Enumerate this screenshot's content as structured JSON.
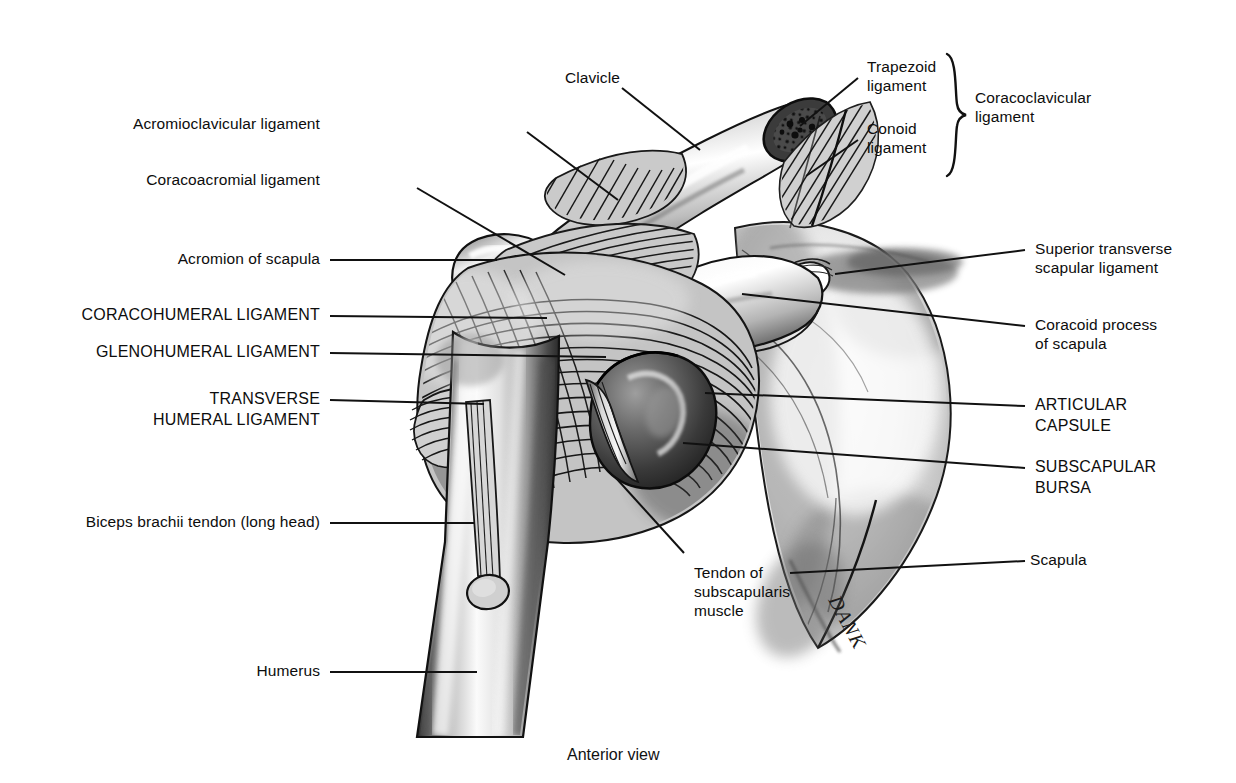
{
  "figure": {
    "caption": "Anterior view",
    "artist_signature": "DANK",
    "background_color": "#ffffff",
    "ink_color": "#111111"
  },
  "labels_left": [
    {
      "id": "acromioclavicular-ligament",
      "text": "Acromioclavicular ligament",
      "emphasis": "normal"
    },
    {
      "id": "coracoacromial-ligament",
      "text": "Coracoacromial ligament",
      "emphasis": "normal"
    },
    {
      "id": "acromion-of-scapula",
      "text": "Acromion of scapula",
      "emphasis": "normal"
    },
    {
      "id": "coracohumeral-ligament",
      "text": "CORACOHUMERAL LIGAMENT",
      "emphasis": "caps"
    },
    {
      "id": "glenohumeral-ligament",
      "text": "GLENOHUMERAL LIGAMENT",
      "emphasis": "caps"
    },
    {
      "id": "transverse-humeral-ligament-l1",
      "text": "TRANSVERSE",
      "emphasis": "caps"
    },
    {
      "id": "transverse-humeral-ligament-l2",
      "text": "HUMERAL LIGAMENT",
      "emphasis": "caps"
    },
    {
      "id": "biceps-brachii-tendon",
      "text": "Biceps brachii tendon (long head)",
      "emphasis": "normal"
    },
    {
      "id": "humerus",
      "text": "Humerus",
      "emphasis": "normal"
    }
  ],
  "labels_top": [
    {
      "id": "clavicle",
      "text": "Clavicle",
      "emphasis": "normal"
    },
    {
      "id": "trapezoid-ligament-l1",
      "text": "Trapezoid",
      "emphasis": "normal"
    },
    {
      "id": "trapezoid-ligament-l2",
      "text": "ligament",
      "emphasis": "normal"
    },
    {
      "id": "conoid-ligament-l1",
      "text": "Conoid",
      "emphasis": "normal"
    },
    {
      "id": "conoid-ligament-l2",
      "text": "ligament",
      "emphasis": "normal"
    },
    {
      "id": "coracoclavicular-ligament-l1",
      "text": "Coracoclavicular",
      "emphasis": "normal"
    },
    {
      "id": "coracoclavicular-ligament-l2",
      "text": "ligament",
      "emphasis": "normal"
    }
  ],
  "labels_right": [
    {
      "id": "superior-transverse-scapular-ligament-l1",
      "text": "Superior transverse",
      "emphasis": "normal"
    },
    {
      "id": "superior-transverse-scapular-ligament-l2",
      "text": "scapular ligament",
      "emphasis": "normal"
    },
    {
      "id": "coracoid-process-of-scapula-l1",
      "text": "Coracoid process",
      "emphasis": "normal"
    },
    {
      "id": "coracoid-process-of-scapula-l2",
      "text": "of scapula",
      "emphasis": "normal"
    },
    {
      "id": "articular-capsule-l1",
      "text": "ARTICULAR",
      "emphasis": "caps"
    },
    {
      "id": "articular-capsule-l2",
      "text": "CAPSULE",
      "emphasis": "caps"
    },
    {
      "id": "subscapular-bursa-l1",
      "text": "SUBSCAPULAR",
      "emphasis": "caps"
    },
    {
      "id": "subscapular-bursa-l2",
      "text": "BURSA",
      "emphasis": "caps"
    },
    {
      "id": "scapula",
      "text": "Scapula",
      "emphasis": "normal"
    }
  ],
  "labels_center": [
    {
      "id": "tendon-of-subscapularis-muscle-l1",
      "text": "Tendon of",
      "emphasis": "normal"
    },
    {
      "id": "tendon-of-subscapularis-muscle-l2",
      "text": "subscapularis",
      "emphasis": "normal"
    },
    {
      "id": "tendon-of-subscapularis-muscle-l3",
      "text": "muscle",
      "emphasis": "normal"
    }
  ]
}
